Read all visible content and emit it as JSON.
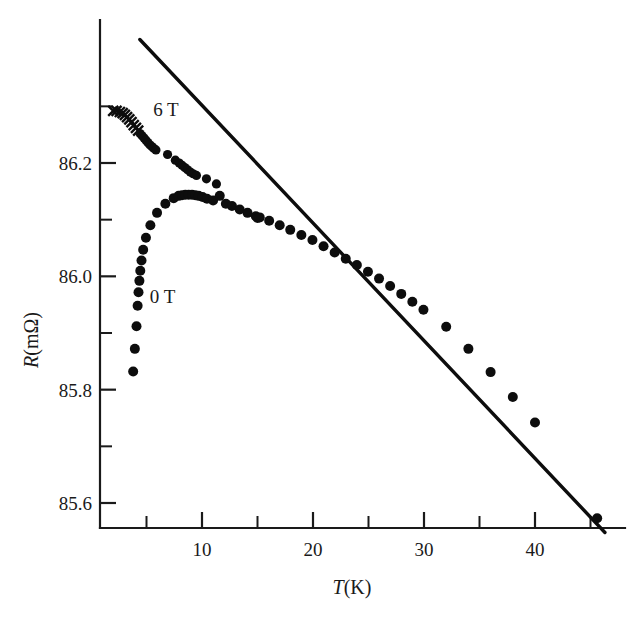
{
  "chart_data": {
    "type": "scatter",
    "title": "",
    "xlabel": "T(K)",
    "ylabel": "R(mΩ)",
    "xlim": [
      0.8,
      47.5
    ],
    "ylim": [
      85.53,
      86.45
    ],
    "grid": false,
    "legend_position": "inline-annotations",
    "x_ticks_major": [
      10,
      20,
      30,
      40
    ],
    "x_ticks_minor": [
      5,
      15,
      25,
      35,
      45
    ],
    "x_tick_labels": [
      "10",
      "20",
      "30",
      "40"
    ],
    "y_ticks_major": [
      86.2,
      86.0,
      85.8,
      85.6
    ],
    "y_ticks_minor": [
      86.3,
      86.1,
      85.9,
      85.7
    ],
    "y_tick_labels": [
      "86.2",
      "86.0",
      "85.8",
      "85.6"
    ],
    "annotations": [
      {
        "text": "6 T",
        "x": 5.6,
        "y": 86.295
      },
      {
        "text": "0 T",
        "x": 5.3,
        "y": 85.965
      }
    ],
    "series": [
      {
        "name": "0 T",
        "marker": "filled-circle",
        "label": "0 T",
        "color": "#0d0d0d",
        "points": [
          [
            3.8,
            85.832
          ],
          [
            3.95,
            85.872
          ],
          [
            4.1,
            85.912
          ],
          [
            4.2,
            85.948
          ],
          [
            4.28,
            85.972
          ],
          [
            4.36,
            85.992
          ],
          [
            4.44,
            86.01
          ],
          [
            4.55,
            86.028
          ],
          [
            4.7,
            86.047
          ],
          [
            4.95,
            86.068
          ],
          [
            5.35,
            86.09
          ],
          [
            5.95,
            86.112
          ],
          [
            6.7,
            86.128
          ],
          [
            7.45,
            86.138
          ],
          [
            7.9,
            86.142
          ],
          [
            8.2,
            86.143
          ],
          [
            8.5,
            86.144
          ],
          [
            8.8,
            86.144
          ],
          [
            9.1,
            86.144
          ],
          [
            9.4,
            86.143
          ],
          [
            9.7,
            86.142
          ],
          [
            10.05,
            86.14
          ],
          [
            10.45,
            86.137
          ],
          [
            11.0,
            86.134
          ],
          [
            11.6,
            86.142
          ],
          [
            12.15,
            86.128
          ],
          [
            12.7,
            86.124
          ],
          [
            13.4,
            86.118
          ],
          [
            14.1,
            86.112
          ],
          [
            14.85,
            86.106
          ],
          [
            15.0,
            86.103
          ],
          [
            15.2,
            86.104
          ],
          [
            16.05,
            86.098
          ],
          [
            17.0,
            86.09
          ],
          [
            17.95,
            86.082
          ],
          [
            18.95,
            86.073
          ],
          [
            19.95,
            86.064
          ],
          [
            20.95,
            86.053
          ],
          [
            21.95,
            86.042
          ],
          [
            22.95,
            86.031
          ],
          [
            23.95,
            86.02
          ],
          [
            24.95,
            86.008
          ],
          [
            25.95,
            85.996
          ],
          [
            26.95,
            85.983
          ],
          [
            27.95,
            85.969
          ],
          [
            28.95,
            85.955
          ],
          [
            29.95,
            85.941
          ],
          [
            32.0,
            85.911
          ],
          [
            34.0,
            85.872
          ],
          [
            36.0,
            85.831
          ],
          [
            38.0,
            85.787
          ],
          [
            40.0,
            85.742
          ],
          [
            45.6,
            85.573
          ]
        ]
      },
      {
        "name": "6 T",
        "marker": "cross-then-circle",
        "label": "6 T",
        "color": "#0d0d0d",
        "cross_count": 11,
        "points": [
          [
            2.0,
            86.292
          ],
          [
            2.3,
            86.292
          ],
          [
            2.6,
            86.29
          ],
          [
            2.85,
            86.288
          ],
          [
            3.05,
            86.285
          ],
          [
            3.25,
            86.281
          ],
          [
            3.45,
            86.277
          ],
          [
            3.65,
            86.272
          ],
          [
            3.85,
            86.267
          ],
          [
            4.05,
            86.262
          ],
          [
            4.25,
            86.257
          ],
          [
            4.42,
            86.252
          ],
          [
            4.6,
            86.248
          ],
          [
            4.78,
            86.244
          ],
          [
            4.95,
            86.24
          ],
          [
            5.12,
            86.236
          ],
          [
            5.3,
            86.232
          ],
          [
            5.48,
            86.229
          ],
          [
            5.65,
            86.226
          ],
          [
            5.85,
            86.223
          ],
          [
            6.9,
            86.215
          ],
          [
            7.6,
            86.205
          ],
          [
            7.95,
            86.2
          ],
          [
            8.2,
            86.196
          ],
          [
            8.45,
            86.192
          ],
          [
            8.7,
            86.188
          ],
          [
            8.95,
            86.184
          ],
          [
            9.2,
            86.181
          ],
          [
            9.5,
            86.178
          ],
          [
            10.4,
            86.172
          ],
          [
            11.3,
            86.163
          ]
        ]
      }
    ],
    "fit_line": {
      "name": "linear-fit",
      "style": "solid",
      "color": "#0d0d0d",
      "x_start": 4.4,
      "y_start": 86.418,
      "x_end": 46.3,
      "y_end": 85.548
    }
  }
}
